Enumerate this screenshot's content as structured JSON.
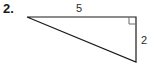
{
  "figure": {
    "problem_number": "2.",
    "shape": "right-triangle",
    "labels": {
      "top_side": "5",
      "right_side": "2",
      "right_angle_marker": "right-angle-square"
    },
    "colors": {
      "background": "#ffffff",
      "stroke": "#1a1a1a",
      "text": "#2b2b2b",
      "number_text": "#1a1a1a"
    },
    "geometry": {
      "vertex_left": [
        27,
        17
      ],
      "vertex_top_right": [
        136,
        17
      ],
      "vertex_bottom_right": [
        136,
        62
      ],
      "right_angle_at": "top-right",
      "square_size": 7
    }
  }
}
